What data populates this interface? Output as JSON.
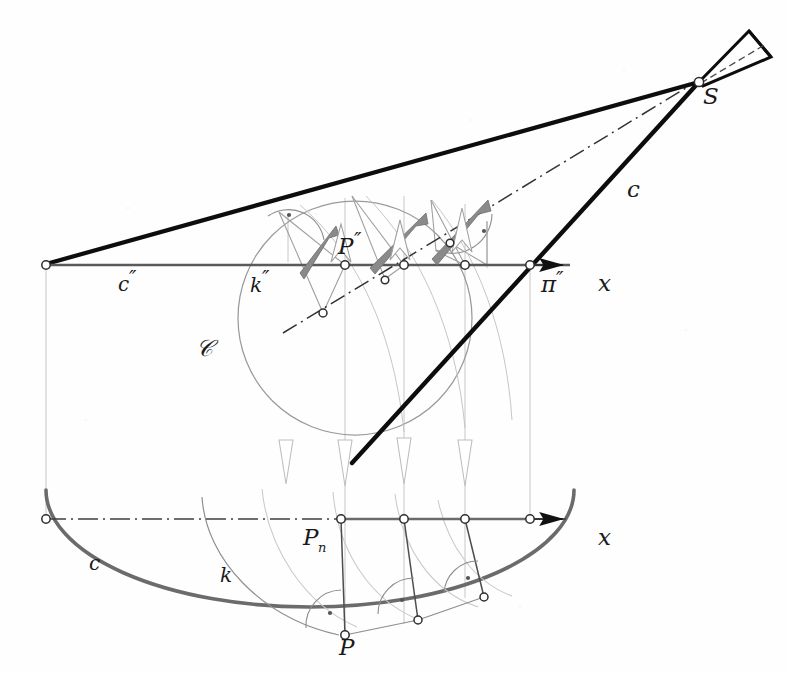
{
  "figure": {
    "background_color": "#fefefe"
  },
  "colors": {
    "ink_black": "#111111",
    "thick_black": "#0d0d0d",
    "medium_gray": "#6e6e6e",
    "light_gray": "#9a9a9a",
    "hairline_gray": "#b5b5b5",
    "arrow_gray": "#8c8c8c",
    "axis_gray": "#555555"
  },
  "labels": [
    {
      "id": "label-S-apex",
      "text": "S",
      "x": 703,
      "y": 104,
      "style": "big",
      "desc": "cone apex point"
    },
    {
      "id": "label-C-cone",
      "text": "ᴄ",
      "x": 627,
      "y": 197,
      "style": "script",
      "desc": "cone generatrix script C"
    },
    {
      "id": "label-pi2",
      "text": "π",
      "x": 541,
      "y": 292,
      "style": "big",
      "desc": "image plane pi double prime"
    },
    {
      "id": "label-x-upper",
      "text": "x",
      "x": 598,
      "y": 291,
      "style": "big",
      "desc": "x axis upper"
    },
    {
      "id": "label-x-lower",
      "text": "x",
      "x": 598,
      "y": 545,
      "style": "big",
      "desc": "x axis lower"
    },
    {
      "id": "label-c2",
      "text": "c",
      "x": 118,
      "y": 291,
      "style": "",
      "desc": "conic c double prime"
    },
    {
      "id": "label-k2",
      "text": "k",
      "x": 250,
      "y": 292,
      "style": "",
      "desc": "auxiliary circle k double prime"
    },
    {
      "id": "label-Sscript",
      "text": "𝒞",
      "x": 196,
      "y": 356,
      "style": "script",
      "desc": "script S surface label"
    },
    {
      "id": "label-P2",
      "text": "P",
      "x": 338,
      "y": 254,
      "style": "big",
      "desc": "point P double prime"
    },
    {
      "id": "label-c",
      "text": "c",
      "x": 89,
      "y": 570,
      "style": "",
      "desc": "conic c in top view"
    },
    {
      "id": "label-k",
      "text": "k",
      "x": 220,
      "y": 582,
      "style": "",
      "desc": "circle k in top view"
    },
    {
      "id": "label-Pn",
      "text": "P",
      "x": 303,
      "y": 545,
      "style": "big",
      "desc": "point P sub n"
    },
    {
      "id": "label-P",
      "text": "P",
      "x": 346,
      "y": 648,
      "style": "big",
      "desc": "point P in top view"
    }
  ],
  "label_decorations": {
    "c2_prime": "″",
    "k2_prime": "″",
    "pi_prime": "″",
    "P2_prime": "″",
    "Pn_subscript": "n"
  },
  "geometry": {
    "upper_axis": {
      "name": "x-axis-upper",
      "x1": 46,
      "y1": 265,
      "x2": 575,
      "y2": 265,
      "arrow_tip_x": 588
    },
    "lower_axis": {
      "name": "x-axis-lower",
      "x1": 46,
      "y1": 519,
      "x2": 575,
      "y2": 519,
      "arrow_tip_x": 588,
      "pattern": "dash-dot"
    },
    "apex": {
      "name": "S",
      "x": 699,
      "y": 82
    },
    "left_vertex": {
      "name": "left-axis-point",
      "x": 46,
      "y": 265
    },
    "right_vertex": {
      "name": "right-axis-point",
      "x": 530,
      "y": 265
    },
    "circle_k2": {
      "cx": 355,
      "cy": 318,
      "r": 117
    },
    "ellipse_c": {
      "cx": 310,
      "cy": 519,
      "rx": 264,
      "ry": 117
    },
    "point_P2": {
      "x": 345,
      "y": 265
    },
    "point_Pn": {
      "x": 341,
      "y": 519
    },
    "point_P": {
      "x": 345,
      "y": 635
    },
    "cone_axis": {
      "x1": 283,
      "y1": 333,
      "x2": 745,
      "y2": 52,
      "pattern": "dash-dot"
    }
  },
  "icons": {
    "arrow_up_solid": "solid-gray-arrowhead-up-right",
    "arrow_down_hollow": "hollow-arrowhead-down",
    "right_angle_mark": "right-angle-arc-with-dot",
    "node_marker": "small-open-circle"
  },
  "annotations": {
    "right_angle_count": 5,
    "projector_count": 4,
    "node_count": 14
  }
}
